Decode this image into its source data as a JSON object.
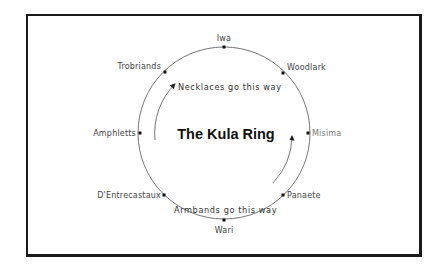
{
  "diagram": {
    "title": "The Kula Ring",
    "ring": {
      "center": [
        224,
        133
      ],
      "radius": 86,
      "stroke": "#666666"
    },
    "islands": [
      {
        "name": "Iwa",
        "dot": [
          224,
          47
        ],
        "label_pos": [
          224,
          41
        ],
        "anchor": "middle"
      },
      {
        "name": "Woodlark",
        "dot": [
          283,
          73
        ],
        "label_pos": [
          287,
          70
        ],
        "anchor": "start"
      },
      {
        "name": "Misima",
        "dot": [
          308,
          133
        ],
        "label_pos": [
          312,
          136
        ],
        "anchor": "start"
      },
      {
        "name": "Panaete",
        "dot": [
          283,
          195
        ],
        "label_pos": [
          287,
          198
        ],
        "anchor": "start"
      },
      {
        "name": "Wari",
        "dot": [
          224,
          220
        ],
        "label_pos": [
          224,
          232
        ],
        "anchor": "middle"
      },
      {
        "name": "D'Entrecastaux",
        "dot": [
          164,
          195
        ],
        "label_pos": [
          161,
          198
        ],
        "anchor": "end"
      },
      {
        "name": "Amphletts",
        "dot": [
          140,
          133
        ],
        "label_pos": [
          136,
          136
        ],
        "anchor": "end"
      },
      {
        "name": "Trobriands",
        "dot": [
          165,
          72
        ],
        "label_pos": [
          161,
          69
        ],
        "anchor": "end"
      }
    ],
    "flows": [
      {
        "label": "Necklaces go this way",
        "label_pos": [
          177,
          90
        ],
        "direction": "clockwise"
      },
      {
        "label": "Armbands go this way",
        "label_pos": [
          173,
          213
        ],
        "direction": "counter-clockwise"
      }
    ]
  }
}
